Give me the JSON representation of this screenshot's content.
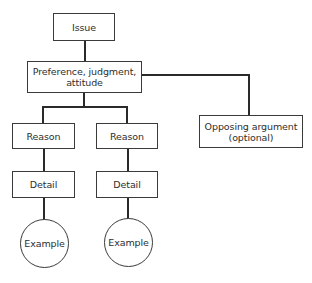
{
  "diagram": {
    "type": "tree",
    "title": "",
    "colors": {
      "line": "#2a2a2a",
      "border": "#3a3a3a",
      "text": "#2e2e2e",
      "background": "#ffffff"
    },
    "nodes": {
      "issue": {
        "label": "Issue",
        "shape": "rectangle"
      },
      "preference": {
        "label_line1": "Preference, judgment,",
        "label_line2": "attitude",
        "shape": "rectangle"
      },
      "opposing": {
        "label_line1": "Opposing argument",
        "label_line2": "(optional)",
        "shape": "rectangle"
      },
      "reason_1": {
        "label": "Reason",
        "shape": "rectangle"
      },
      "reason_2": {
        "label": "Reason",
        "shape": "rectangle"
      },
      "detail_1": {
        "label": "Detail",
        "shape": "rectangle"
      },
      "detail_2": {
        "label": "Detail",
        "shape": "rectangle"
      },
      "example_1": {
        "label": "Example",
        "shape": "circle"
      },
      "example_2": {
        "label": "Example",
        "shape": "circle"
      }
    },
    "edges": [
      {
        "from": "issue",
        "to": "preference"
      },
      {
        "from": "preference",
        "to": "reason_1"
      },
      {
        "from": "preference",
        "to": "reason_2"
      },
      {
        "from": "preference",
        "to": "opposing"
      },
      {
        "from": "reason_1",
        "to": "detail_1"
      },
      {
        "from": "reason_2",
        "to": "detail_2"
      },
      {
        "from": "detail_1",
        "to": "example_1"
      },
      {
        "from": "detail_2",
        "to": "example_2"
      }
    ]
  }
}
